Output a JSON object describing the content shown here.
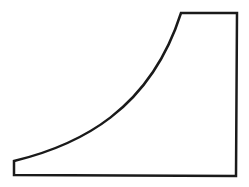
{
  "diagram": {
    "shape": "curved-ramp-profile",
    "stroke_color": "#1a1a1a",
    "fill_color": "#ffffff",
    "stroke_width": 2.5,
    "points": {
      "bottom_left": [
        14,
        175
      ],
      "curve_start": [
        14,
        161
      ],
      "curve_control_1": [
        80,
        145
      ],
      "curve_control_2": [
        150,
        110
      ],
      "curve_end": [
        181,
        13
      ],
      "top_right": [
        237,
        13
      ],
      "bottom_right": [
        236,
        176
      ]
    }
  }
}
